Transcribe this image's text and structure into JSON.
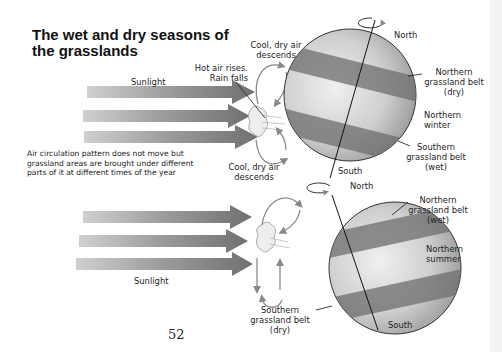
{
  "title": "The wet and dry seasons of the grasslands",
  "note": "Air circulation pattern does not move but grassland areas are brought under different parts of it at different times of the year",
  "page_number": "52",
  "top_diagram": {
    "sunlight_label": "Sunlight",
    "hot_air_label_1": "Hot air rises.",
    "hot_air_label_2": "Rain falls",
    "cool_air_top_1": "Cool, dry air",
    "cool_air_top_2": "descends",
    "cool_air_bottom_1": "Cool, dry air",
    "cool_air_bottom_2": "descends",
    "north": "North",
    "south": "South",
    "northern_belt_1": "Northern",
    "northern_belt_2": "grassland belt",
    "northern_belt_3": "(dry)",
    "season_1": "Northern",
    "season_2": "winter",
    "southern_belt_1": "Southern",
    "southern_belt_2": "grassland belt",
    "southern_belt_3": "(wet)"
  },
  "bottom_diagram": {
    "sunlight_label": "Sunlight",
    "north": "North",
    "south": "South",
    "northern_belt_1": "Northern",
    "northern_belt_2": "grassland belt",
    "northern_belt_3": "(wet)",
    "season_1": "Northern",
    "season_2": "summer",
    "southern_belt_1": "Southern",
    "southern_belt_2": "grassland belt",
    "southern_belt_3": "(dry)"
  },
  "colors": {
    "globe_light": "#d8d8d8",
    "globe_dark": "#8a8a8a",
    "belt": "#6e6e6e",
    "arrow": "#7a7a7a"
  }
}
